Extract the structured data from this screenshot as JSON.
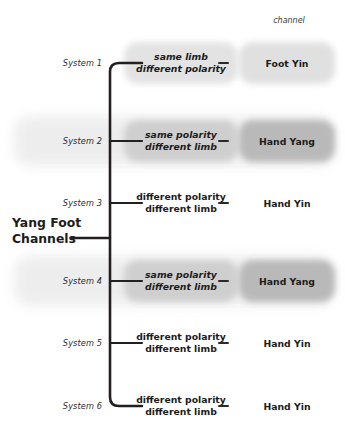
{
  "diagram": {
    "root_label_line1": "Yang Foot",
    "root_label_line2": "Channels",
    "column_header": "channel"
  },
  "rows": [
    {
      "system": "System 1",
      "relation_line1": "same limb",
      "relation_line2": "different polarity",
      "channel": "Foot Yin",
      "relation_highlight": "#e3e3e3",
      "channel_highlight": "#e0e0e0",
      "row_band": "",
      "emphasis": "light"
    },
    {
      "system": "System 2",
      "relation_line1": "same polarity",
      "relation_line2": "different limb",
      "channel": "Hand Yang",
      "relation_highlight": "#cfcfcf",
      "channel_highlight": "#b9b9b9",
      "row_band": "#ededed",
      "emphasis": "strong"
    },
    {
      "system": "System 3",
      "relation_line1": "different polarity",
      "relation_line2": "different limb",
      "channel": "Hand Yin",
      "relation_highlight": "",
      "channel_highlight": "",
      "row_band": "",
      "emphasis": "none"
    },
    {
      "system": "System 4",
      "relation_line1": "same polarity",
      "relation_line2": "different limb",
      "channel": "Hand Yang",
      "relation_highlight": "#cfcfcf",
      "channel_highlight": "#b9b9b9",
      "row_band": "#ededed",
      "emphasis": "strong"
    },
    {
      "system": "System 5",
      "relation_line1": "different polarity",
      "relation_line2": "different limb",
      "channel": "Hand Yin",
      "relation_highlight": "",
      "channel_highlight": "",
      "row_band": "",
      "emphasis": "none"
    },
    {
      "system": "System 6",
      "relation_line1": "different polarity",
      "relation_line2": "different limb",
      "channel": "Hand Yin",
      "relation_highlight": "",
      "channel_highlight": "",
      "row_band": "",
      "emphasis": "none"
    }
  ],
  "geometry": {
    "row_y": [
      63,
      141,
      203,
      281,
      343,
      406
    ],
    "trunk_x": 110,
    "trunk_top": 63,
    "trunk_bottom": 406,
    "branch_end_x": 142,
    "root_connector_y": 238
  },
  "colors": {
    "ink": "#231f20",
    "background": "#ffffff"
  }
}
